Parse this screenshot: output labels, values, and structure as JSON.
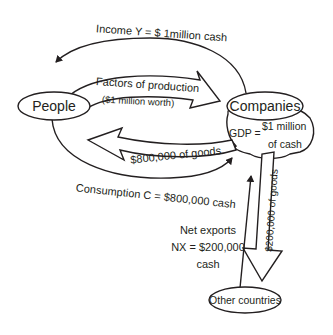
{
  "diagram": {
    "type": "circular-flow",
    "nodes": {
      "people": "People",
      "companies": "Companies",
      "other_countries": "Other countries"
    },
    "flows": {
      "income": "Income Y = $ 1million cash",
      "factors_line1": "Factors of production",
      "factors_line2": "($1 million worth)",
      "goods_domestic": "$800,000 of goods",
      "consumption": "Consumption C = $800,000 cash",
      "goods_export": "$200,000 of goods",
      "net_exports_line1": "Net exports",
      "net_exports_line2": "NX = $200,000",
      "net_exports_line3": "cash"
    },
    "gdp": {
      "line1": "GDP =",
      "line2": "$1 million",
      "line3": "of cash"
    },
    "colors": {
      "ink": "#231f20",
      "background": "#ffffff"
    }
  }
}
